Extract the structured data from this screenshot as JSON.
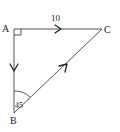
{
  "diagram": {
    "type": "vector-triangle",
    "vertices": {
      "A": {
        "label": "A"
      },
      "B": {
        "label": "B"
      },
      "C": {
        "label": "C"
      }
    },
    "edges": [
      {
        "from": "A",
        "to": "C",
        "label": "10",
        "arrow_direction": "A-to-C"
      },
      {
        "from": "A",
        "to": "B",
        "label": "",
        "arrow_direction": "A-to-B"
      },
      {
        "from": "B",
        "to": "C",
        "label": "",
        "arrow_direction": "B-to-C"
      }
    ],
    "right_angle_at": "A",
    "angle_marks": [
      {
        "vertex": "B",
        "label": "45"
      }
    ],
    "colors": {
      "line": "#555555",
      "text": "#222222",
      "background": "#ffffff"
    }
  }
}
